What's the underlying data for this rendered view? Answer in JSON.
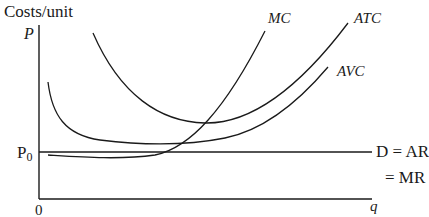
{
  "diagram": {
    "type": "cost_curves_perfect_competition",
    "y_axis_title": "Costs/unit",
    "y_axis_label": "P",
    "x_axis_label": "q",
    "origin_label": "0",
    "price_level_label": "P",
    "price_level_subscript": "0",
    "demand_label": "D = AR",
    "mr_label": "= MR",
    "curves": [
      {
        "name": "MC",
        "label": "MC"
      },
      {
        "name": "ATC",
        "label": "ATC"
      },
      {
        "name": "AVC",
        "label": "AVC"
      }
    ],
    "line_color": "#1a1a1a"
  }
}
